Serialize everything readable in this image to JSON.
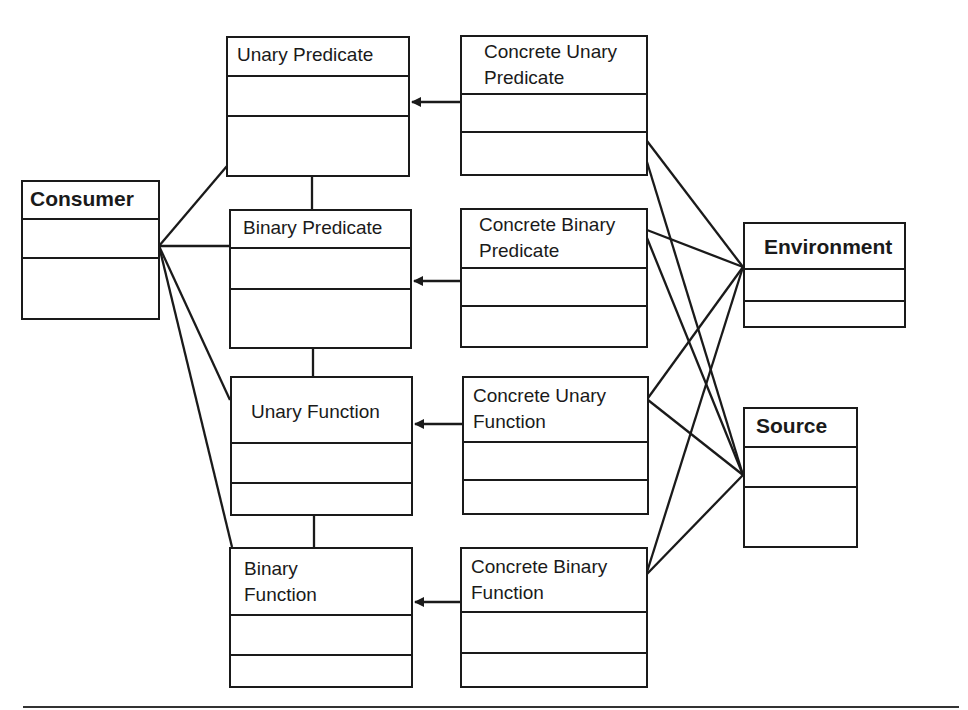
{
  "diagram": {
    "type": "uml-class-diagram",
    "classes": {
      "consumer": {
        "name": "Consumer",
        "bold": true
      },
      "unary_predicate": {
        "name": "Unary Predicate",
        "bold": false
      },
      "binary_predicate": {
        "name": "Binary Predicate",
        "bold": false
      },
      "unary_function": {
        "name": "Unary Function",
        "bold": false
      },
      "binary_function": {
        "name": "Binary\nFunction",
        "bold": false
      },
      "concrete_unary_predicate": {
        "name": "Concrete Unary\nPredicate",
        "bold": false
      },
      "concrete_binary_predicate": {
        "name": "Concrete Binary\nPredicate",
        "bold": false
      },
      "concrete_unary_function": {
        "name": "Concrete Unary\nFunction",
        "bold": false
      },
      "concrete_binary_function": {
        "name": "Concrete Binary\nFunction",
        "bold": false
      },
      "environment": {
        "name": "Environment",
        "bold": true
      },
      "source": {
        "name": "Source",
        "bold": true
      }
    },
    "relationships": [
      {
        "from": "Concrete Unary Predicate",
        "to": "Unary Predicate",
        "kind": "generalization-arrow"
      },
      {
        "from": "Concrete Binary Predicate",
        "to": "Binary Predicate",
        "kind": "generalization-arrow"
      },
      {
        "from": "Concrete Unary Function",
        "to": "Unary Function",
        "kind": "generalization-arrow"
      },
      {
        "from": "Concrete Binary Function",
        "to": "Binary Function",
        "kind": "generalization-arrow"
      },
      {
        "from": "Unary Predicate",
        "to": "Binary Predicate",
        "kind": "association"
      },
      {
        "from": "Binary Predicate",
        "to": "Unary Function",
        "kind": "association"
      },
      {
        "from": "Unary Function",
        "to": "Binary Function",
        "kind": "association"
      },
      {
        "from": "Consumer",
        "to": "Unary Predicate",
        "kind": "association"
      },
      {
        "from": "Consumer",
        "to": "Binary Predicate",
        "kind": "association"
      },
      {
        "from": "Consumer",
        "to": "Unary Function",
        "kind": "association"
      },
      {
        "from": "Consumer",
        "to": "Binary Function",
        "kind": "association"
      },
      {
        "from": "Concrete Unary Predicate",
        "to": "Environment",
        "kind": "association"
      },
      {
        "from": "Concrete Unary Predicate",
        "to": "Source",
        "kind": "association"
      },
      {
        "from": "Concrete Binary Predicate",
        "to": "Environment",
        "kind": "association"
      },
      {
        "from": "Concrete Binary Predicate",
        "to": "Source",
        "kind": "association"
      },
      {
        "from": "Concrete Unary Function",
        "to": "Environment",
        "kind": "association"
      },
      {
        "from": "Concrete Unary Function",
        "to": "Source",
        "kind": "association"
      },
      {
        "from": "Concrete Binary Function",
        "to": "Environment",
        "kind": "association"
      },
      {
        "from": "Concrete Binary Function",
        "to": "Source",
        "kind": "association"
      }
    ],
    "line_color": "#1a1a1a",
    "background": "#ffffff"
  }
}
